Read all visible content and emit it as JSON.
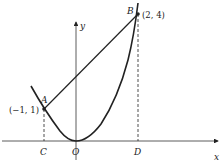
{
  "diagram": {
    "axes": {
      "x_label": "x",
      "y_label": "y"
    },
    "points": {
      "A": {
        "label": "A",
        "coord": "(−1, 1)"
      },
      "B": {
        "label": "B",
        "coord": "(2, 4)"
      },
      "C": {
        "label": "C"
      },
      "O": {
        "label": "O"
      },
      "D": {
        "label": "D"
      }
    },
    "curve": "y = x^2",
    "segments": [
      "AB",
      "AC (dashed)",
      "BD (dashed)"
    ]
  }
}
